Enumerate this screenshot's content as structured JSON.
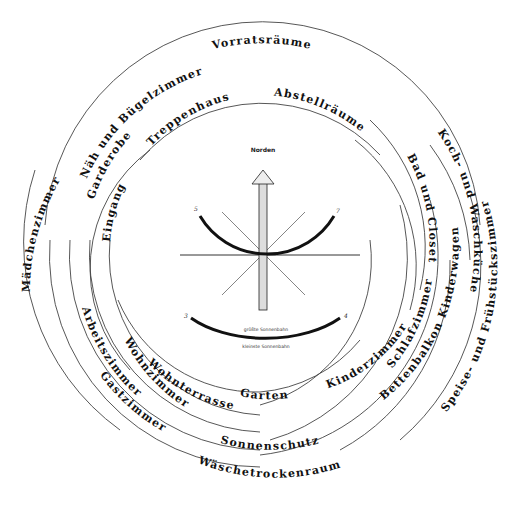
{
  "compass": {
    "north_label": "Norden",
    "sun_path_large": "größte Sonnenbahn",
    "sun_path_small": "kleinste Sonnenbahn",
    "markers": [
      "5",
      "7",
      "3",
      "4"
    ]
  },
  "rooms": {
    "outer_top": "Vorratsräume",
    "top_right_ring": "Abstellräume",
    "top_left_ring": "Treppenhaus",
    "entrance": "Eingang",
    "wardrobe": "Garderobe",
    "sewing": "Näh und Bügelzimmer",
    "maid": "Mädchenzimmer",
    "bath": "Bad und Closet",
    "kitchen": "Koch- und Waschküche",
    "breakfast": "Speise- und Frühstückszimmer",
    "bedroom": "Schlafzimmer",
    "balcony": "Bettenbalkon Kinderwagen",
    "children": "Kinderzimmer",
    "garden": "Garten",
    "terrace": "Wohnterrasse",
    "living": "Wohnzimmer",
    "study": "Arbeitszimmer",
    "guest": "Gastzimmer",
    "sunshade": "Sonnenschutz",
    "laundry": "Wäschetrockenraum"
  }
}
